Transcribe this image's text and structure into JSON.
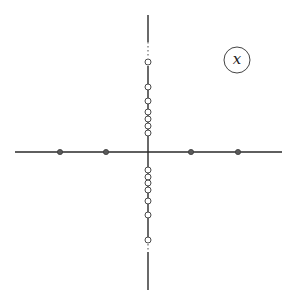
{
  "diagram": {
    "label": "x",
    "label_circle": {
      "cx": 237,
      "cy": 60,
      "r": 13
    },
    "origin": {
      "x": 148,
      "y": 152
    },
    "horizontal_axis": {
      "x1": 15,
      "x2": 282,
      "y": 152
    },
    "vertical_axis": {
      "x": 148,
      "solid_segments": [
        [
          15,
          42
        ],
        [
          66,
          238
        ],
        [
          252,
          290
        ]
      ],
      "dotted_segments": [
        [
          42,
          58
        ],
        [
          240,
          252
        ]
      ]
    },
    "real_axis_points": [
      60,
      106,
      191,
      238
    ],
    "imaginary_axis_open_circles_upper": [
      62,
      87,
      101,
      112,
      119,
      126,
      133
    ],
    "imaginary_axis_open_circles_lower": [
      170,
      177,
      183,
      190,
      201,
      215,
      240
    ],
    "colors": {
      "axis": "#2a2a2a",
      "filled_point": "#5a5a5a",
      "open_circle_stroke": "#4a4a4a",
      "background": "#ffffff"
    }
  }
}
